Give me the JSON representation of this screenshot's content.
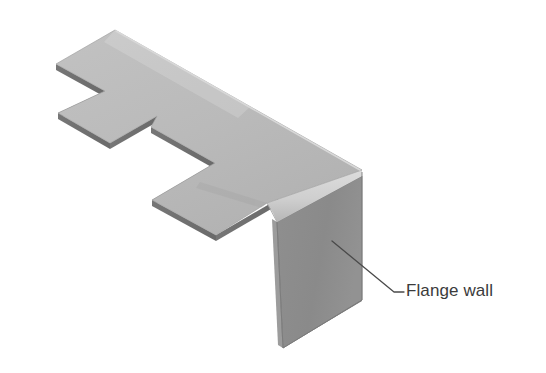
{
  "figure": {
    "title": "Flange wall",
    "background_color": "#ffffff"
  },
  "callouts": [
    {
      "id": "flange-wall",
      "label": "Flange wall",
      "text_color": "#3b3b3b",
      "leader_color": "#4a4a4a",
      "anchor_point": {
        "x": 332,
        "y": 241
      },
      "elbow_point": {
        "x": 394,
        "y": 292
      },
      "text_point": {
        "x": 404,
        "y": 292
      }
    }
  ],
  "part": {
    "name": "bent-sheet-metal-bracket",
    "faces": [
      {
        "name": "top-face",
        "role": "Top flat web surface of the sheet metal part",
        "fill": "#b9b9b9",
        "points": "115,30 362,172 362,176 332,200 267,203 259,196 215,173 215,168 151,132 150,127 105,101 105,96 56,69 56,64"
      },
      {
        "name": "left-tab-top-face",
        "role": "Narrow tab protruding from the left end",
        "fill": "#b9b9b9",
        "points": "56,118 110,149 157,122 105,92"
      },
      {
        "name": "flange-wall-face",
        "role": "Vertical bent flange wall",
        "fill": "#8c8c8c",
        "points": "277,222 362,172 362,300 283,348"
      },
      {
        "name": "bend-highlight",
        "role": "Highlight band along the bend radius",
        "fill": "#d2d2d2",
        "points": "267,203 332,200 362,172 362,176"
      },
      {
        "name": "edge-thickness",
        "role": "Visible material thickness along the cut edges",
        "fill": "#6f6f6f"
      }
    ],
    "material_thickness_px": 6
  },
  "colors": {
    "top_face": "#b9b9b9",
    "flange_face": "#8c8c8c",
    "bend_highlight": "#d2d2d2",
    "edge_dark": "#6f6f6f",
    "outline": "#8a8a8a",
    "text": "#3b3b3b",
    "leader": "#4a4a4a",
    "background": "#ffffff"
  }
}
